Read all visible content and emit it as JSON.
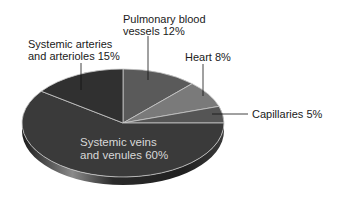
{
  "chart_data": {
    "type": "pie",
    "title": "",
    "style": "3d-tilted",
    "categories": [
      "Systemic veins and venules",
      "Systemic arteries and arterioles",
      "Pulmonary blood vessels",
      "Heart",
      "Capillaries"
    ],
    "values": [
      60,
      15,
      12,
      8,
      5
    ],
    "unit": "%",
    "colors": [
      "#3a3a3a",
      "#303030",
      "#5a5a5a",
      "#7a7a7a",
      "#555555"
    ],
    "labels": [
      {
        "line1": "Systemic veins",
        "line2": "and venules 60%"
      },
      {
        "line1": "Systemic arteries",
        "line2": "and arterioles 15%"
      },
      {
        "line1": "Pulmonary blood",
        "line2": "vessels 12%"
      },
      {
        "line1": "Heart 8%",
        "line2": ""
      },
      {
        "line1": "Capillaries 5%",
        "line2": ""
      }
    ]
  }
}
